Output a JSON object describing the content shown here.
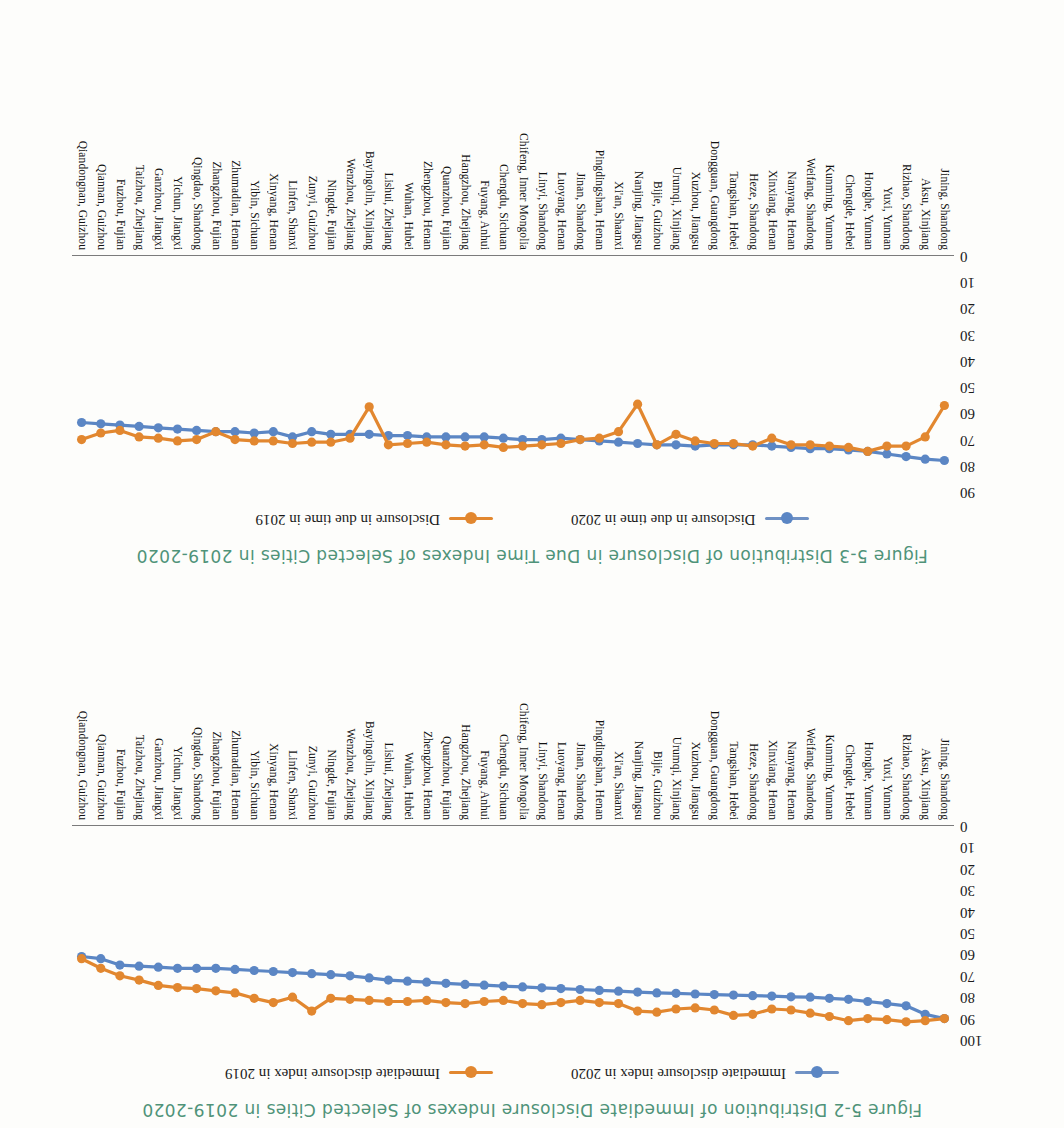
{
  "page": {
    "orientation": "upside-down-scan",
    "background": "#fdfdfb"
  },
  "colors": {
    "series_2020": "#5b86c4",
    "series_2019": "#e2872f",
    "title": "#4f9379",
    "axis": "#7b7b7b",
    "text": "#111111"
  },
  "figures": {
    "immediate": {
      "title": "Figure 5-2   Distribution of Immediate Disclosure Indexes of Selected Cities in 2019-2020",
      "legend": [
        {
          "label": "Immediate disclosure index in 2020",
          "color": "#5b86c4"
        },
        {
          "label": "Immediate disclosure index in 2019",
          "color": "#e2872f"
        }
      ]
    },
    "duetime": {
      "title": "Figure 5-3   Distribution of Disclosure in Due Time Indexes of Selected Cities in 2019-2020",
      "legend": [
        {
          "label": "Disclosure in due time in 2020",
          "color": "#5b86c4"
        },
        {
          "label": "Disclosure in due time in 2019",
          "color": "#e2872f"
        }
      ]
    }
  },
  "cities": [
    "Jining, Shandong",
    "Aksu, Xinjiang",
    "Rizhao, Shandong",
    "Yuxi, Yunnan",
    "Honghe, Yunnan",
    "Chengde, Hebei",
    "Kunming, Yunnan",
    "Weifang, Shandong",
    "Nanyang, Henan",
    "Xinxiang, Henan",
    "Heze, Shandong",
    "Tangshan, Hebei",
    "Dongguan, Guangdong",
    "Xuzhou, Jiangsu",
    "Urumqi, Xinjiang",
    "Bijie, Guizhou",
    "Nanjing, Jiangsu",
    "Xi'an, Shaanxi",
    "Pingdingshan, Henan",
    "Jinan, Shandong",
    "Luoyang, Henan",
    "Linyi, Shandong",
    "Chifeng, Inner Mongolia",
    "Chengdu, Sichuan",
    "Fuyang, Anhui",
    "Hangzhou, Zhejiang",
    "Quanzhou, Fujian",
    "Zhengzhou, Henan",
    "Wuhan, Hubei",
    "Lishui, Zhejiang",
    "Bayingolin, Xinjiang",
    "Wenzhou, Zhejiang",
    "Ningde, Fujian",
    "Zunyi, Guizhou",
    "Linfen, Shanxi",
    "Xinyang, Henan",
    "Yibin, Sichuan",
    "Zhumadian, Henan",
    "Zhangzhou, Fujian",
    "Qingdao, Shandong",
    "Yichun, Jiangxi",
    "Ganzhou, Jiangxi",
    "Taizhou, Zhejiang",
    "Fuzhou, Fujian",
    "Qiannan, Guizhou",
    "Qiandongnan, Guizhou"
  ],
  "chart_data": [
    {
      "id": "immediate",
      "type": "line",
      "title": "Figure 5-2   Distribution of Immediate Disclosure Indexes of Selected Cities in 2019-2020",
      "xlabel": "",
      "ylabel": "",
      "ylim": [
        0,
        100
      ],
      "yticks": [
        0,
        10,
        20,
        30,
        40,
        50,
        60,
        70,
        80,
        90,
        100
      ],
      "grid": false,
      "legend_position": "top-center",
      "categories": [
        "Jining, Shandong",
        "Aksu, Xinjiang",
        "Rizhao, Shandong",
        "Yuxi, Yunnan",
        "Honghe, Yunnan",
        "Chengde, Hebei",
        "Kunming, Yunnan",
        "Weifang, Shandong",
        "Nanyang, Henan",
        "Xinxiang, Henan",
        "Heze, Shandong",
        "Tangshan, Hebei",
        "Dongguan, Guangdong",
        "Xuzhou, Jiangsu",
        "Urumqi, Xinjiang",
        "Bijie, Guizhou",
        "Nanjing, Jiangsu",
        "Xi'an, Shaanxi",
        "Pingdingshan, Henan",
        "Jinan, Shandong",
        "Luoyang, Henan",
        "Linyi, Shandong",
        "Chifeng, Inner Mongolia",
        "Chengdu, Sichuan",
        "Fuyang, Anhui",
        "Hangzhou, Zhejiang",
        "Quanzhou, Fujian",
        "Zhengzhou, Henan",
        "Wuhan, Hubei",
        "Lishui, Zhejiang",
        "Bayingolin, Xinjiang",
        "Wenzhou, Zhejiang",
        "Ningde, Fujian",
        "Zunyi, Guizhou",
        "Linfen, Shanxi",
        "Xinyang, Henan",
        "Yibin, Sichuan",
        "Zhumadian, Henan",
        "Zhangzhou, Fujian",
        "Qingdao, Shandong",
        "Yichun, Jiangxi",
        "Ganzhou, Jiangxi",
        "Taizhou, Zhejiang",
        "Fuzhou, Fujian",
        "Qiannan, Guizhou",
        "Qiandongnan, Guizhou"
      ],
      "series": [
        {
          "name": "Immediate disclosure index in 2020",
          "color": "#5b86c4",
          "values": [
            90.0,
            88.0,
            84.0,
            83.0,
            82.0,
            81.0,
            80.5,
            80.0,
            79.8,
            79.5,
            79.3,
            79.0,
            78.8,
            78.5,
            78.2,
            78.0,
            77.6,
            77.2,
            76.8,
            76.4,
            76.0,
            75.6,
            75.2,
            74.8,
            74.4,
            74.0,
            73.5,
            73.0,
            72.5,
            72.0,
            71.0,
            70.0,
            69.5,
            69.0,
            68.5,
            68.0,
            67.5,
            67.0,
            66.5,
            66.5,
            66.5,
            66.0,
            65.5,
            65.0,
            62.0,
            61.0
          ]
        },
        {
          "name": "Immediate disclosure index in 2019",
          "color": "#e2872f",
          "values": [
            90.0,
            91.0,
            91.5,
            90.5,
            90.0,
            91.0,
            89.0,
            87.5,
            86.0,
            85.5,
            88.0,
            88.5,
            86.0,
            85.0,
            85.5,
            87.0,
            86.5,
            83.0,
            82.5,
            81.5,
            82.5,
            83.5,
            83.0,
            81.5,
            82.0,
            83.0,
            82.5,
            81.5,
            82.0,
            82.0,
            81.5,
            81.0,
            80.5,
            86.5,
            80.0,
            82.5,
            80.5,
            78.0,
            77.0,
            76.0,
            75.5,
            74.5,
            72.0,
            70.0,
            66.5,
            62.0
          ]
        }
      ]
    },
    {
      "id": "duetime",
      "type": "line",
      "title": "Figure 5-3   Distribution of Disclosure in Due Time Indexes of Selected Cities in 2019-2020",
      "xlabel": "",
      "ylabel": "",
      "ylim": [
        0,
        90
      ],
      "yticks": [
        0,
        10,
        20,
        30,
        40,
        50,
        60,
        70,
        80,
        90
      ],
      "grid": false,
      "legend_position": "top-center",
      "categories": [
        "Jining, Shandong",
        "Aksu, Xinjiang",
        "Rizhao, Shandong",
        "Yuxi, Yunnan",
        "Honghe, Yunnan",
        "Chengde, Hebei",
        "Kunming, Yunnan",
        "Weifang, Shandong",
        "Nanyang, Henan",
        "Xinxiang, Henan",
        "Heze, Shandong",
        "Tangshan, Hebei",
        "Dongguan, Guangdong",
        "Xuzhou, Jiangsu",
        "Urumqi, Xinjiang",
        "Bijie, Guizhou",
        "Nanjing, Jiangsu",
        "Xi'an, Shaanxi",
        "Pingdingshan, Henan",
        "Jinan, Shandong",
        "Luoyang, Henan",
        "Linyi, Shandong",
        "Chifeng, Inner Mongolia",
        "Chengdu, Sichuan",
        "Fuyang, Anhui",
        "Hangzhou, Zhejiang",
        "Quanzhou, Fujian",
        "Zhengzhou, Henan",
        "Wuhan, Hubei",
        "Lishui, Zhejiang",
        "Bayingolin, Xinjiang",
        "Wenzhou, Zhejiang",
        "Ningde, Fujian",
        "Zunyi, Guizhou",
        "Linfen, Shanxi",
        "Xinyang, Henan",
        "Yibin, Sichuan",
        "Zhumadian, Henan",
        "Zhangzhou, Fujian",
        "Qingdao, Shandong",
        "Yichun, Jiangxi",
        "Ganzhou, Jiangxi",
        "Taizhou, Zhejiang",
        "Fuzhou, Fujian",
        "Qiannan, Guizhou",
        "Qiandongnan, Guizhou"
      ],
      "series": [
        {
          "name": "Disclosure in due time in 2020",
          "color": "#5b86c4",
          "values": [
            78.0,
            77.5,
            76.5,
            75.5,
            74.5,
            74.0,
            73.5,
            73.5,
            73.0,
            72.5,
            72.0,
            72.0,
            72.0,
            72.5,
            72.0,
            72.0,
            71.5,
            71.0,
            70.5,
            70.0,
            69.5,
            70.0,
            70.0,
            69.5,
            69.0,
            69.0,
            69.0,
            69.0,
            68.5,
            68.5,
            68.0,
            68.0,
            68.0,
            67.0,
            69.0,
            67.0,
            67.5,
            67.0,
            67.0,
            66.5,
            66.0,
            65.5,
            65.0,
            64.5,
            64.0,
            63.5
          ]
        },
        {
          "name": "Disclosure in due time in 2019",
          "color": "#e2872f",
          "values": [
            57.0,
            69.0,
            72.5,
            72.5,
            74.5,
            73.0,
            72.5,
            72.0,
            72.0,
            69.5,
            72.5,
            71.5,
            71.5,
            70.5,
            68.0,
            72.0,
            56.5,
            67.0,
            69.5,
            70.0,
            71.5,
            72.0,
            72.5,
            73.0,
            72.0,
            72.5,
            72.0,
            71.0,
            71.5,
            72.0,
            57.5,
            69.5,
            71.0,
            71.0,
            71.5,
            70.5,
            70.5,
            70.0,
            67.0,
            70.0,
            70.5,
            69.5,
            69.0,
            66.5,
            67.5,
            70.0
          ]
        }
      ]
    }
  ]
}
